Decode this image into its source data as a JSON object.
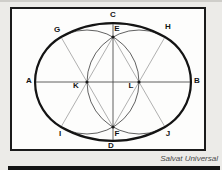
{
  "diagram": {
    "type": "geometric-construction-oval",
    "point_labels": [
      "A",
      "B",
      "C",
      "D",
      "E",
      "F",
      "G",
      "H",
      "I",
      "J",
      "K",
      "L"
    ]
  },
  "caption": "Salvat Universal",
  "colors": {
    "page_background": "#ecebe8",
    "frame_background": "#fdfdfc",
    "outline_ink": "#141414",
    "construction_line": "#4f4f4f",
    "light_construction_line": "#9c9c9c",
    "caption_text": "#4a4a4a",
    "bottom_bar": "#141414"
  }
}
